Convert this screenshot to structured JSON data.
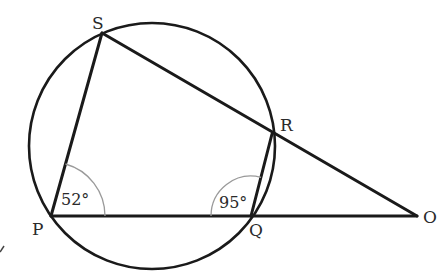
{
  "diagram": {
    "points": {
      "S": {
        "label": "S"
      },
      "R": {
        "label": "R"
      },
      "P": {
        "label": "P"
      },
      "Q": {
        "label": "Q"
      },
      "O": {
        "label": "O"
      }
    },
    "angles": {
      "P": {
        "label": "52°",
        "vertex": "P",
        "between": [
          "S",
          "Q"
        ]
      },
      "Q": {
        "label": "95°",
        "vertex": "Q",
        "between": [
          "P",
          "R"
        ]
      }
    },
    "segments": [
      "PS",
      "SR",
      "RO",
      "RQ",
      "PQ",
      "QO"
    ],
    "circle": {
      "through": [
        "P",
        "Q",
        "R",
        "S"
      ]
    }
  }
}
